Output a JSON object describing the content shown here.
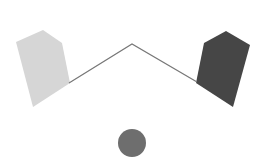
{
  "canvas": {
    "width": 273,
    "height": 164,
    "background": "#ffffff"
  },
  "shapes": {
    "left_pentagon": {
      "points": "16,42 43,30 62,43 70,83 33,107",
      "fill": "#d6d6d6"
    },
    "right_pentagon": {
      "points": "204,43 226,31 250,45 233,107 196,83",
      "fill": "#464646"
    },
    "connector_line": {
      "points": "69,83 132,44 197,82",
      "stroke": "#777777",
      "stroke_width": 1.2
    },
    "circle": {
      "cx": 132,
      "cy": 143,
      "r": 14,
      "fill": "#6e6e6e"
    }
  }
}
